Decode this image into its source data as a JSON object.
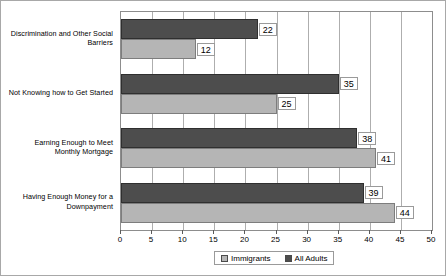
{
  "chart_data": {
    "type": "bar",
    "orientation": "horizontal",
    "title": "",
    "xlabel": "",
    "ylabel": "",
    "xlim": [
      0,
      50
    ],
    "xticks": [
      0,
      5,
      10,
      15,
      20,
      25,
      30,
      35,
      40,
      45,
      50
    ],
    "grid": true,
    "legend_position": "bottom",
    "categories": [
      "Discrimination and Other Social Barriers",
      "Not Knowing how to Get Started",
      "Earning Enough to Meet Monthly Mortgage",
      "Having Enough Money for a Downpayment"
    ],
    "category_lines": [
      [
        "Discrimination and Other Social",
        "Barriers"
      ],
      [
        "Not Knowing how to Get Started"
      ],
      [
        "Earning Enough to Meet",
        "Monthly Mortgage"
      ],
      [
        "Having Enough Money for a",
        "Downpayment"
      ]
    ],
    "series": [
      {
        "name": "All Adults",
        "color": "#4d4d4d",
        "values": [
          22,
          35,
          38,
          39
        ]
      },
      {
        "name": "Immigrants",
        "color": "#b5b5b5",
        "values": [
          12,
          25,
          41,
          44
        ]
      }
    ],
    "legend_order": [
      "Immigrants",
      "All Adults"
    ]
  }
}
